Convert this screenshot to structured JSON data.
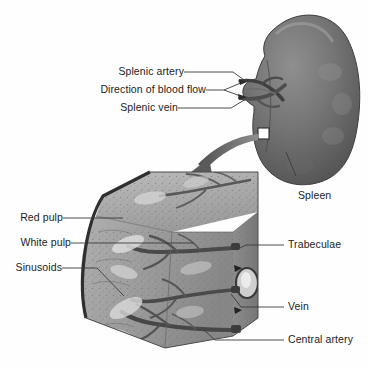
{
  "figure": {
    "background_color": "#fefefe",
    "text_color": "#1c1c1c",
    "leader_line_color": "#3a3a3a"
  },
  "organ": {
    "name": "spleen",
    "shape": "comma-shaped organ with hilum notch on medial (left) border",
    "fill_dark": "#5e5e5e",
    "fill_mid": "#7b7b7b",
    "fill_light": "#9a9a9a",
    "outline_color": "#3d3d3d"
  },
  "inset_box": {
    "name": "sample-region-box",
    "stroke": "#2b2b2b",
    "fill": "#ffffff"
  },
  "magnify_arrow": {
    "name": "magnification-arrow",
    "direction": "from spleen sample box down-left to tissue block",
    "color": "#6e6e6e"
  },
  "tissue_block": {
    "name": "splenic-tissue-cutaway-block",
    "capsule_color": "#2f2f2f",
    "top_face_color": "#a8a8a8",
    "front_face_color": "#9d9d9d",
    "side_face_color": "#8a8a8a",
    "vessel_color": "#4a4a4a",
    "white_pulp_color": "#d8d8d8",
    "vein_ring_color": "#3a3a3a"
  },
  "labels": {
    "splenic_artery": "Splenic artery",
    "direction_of_blood_flow": "Direction of blood flow",
    "splenic_vein": "Splenic vein",
    "spleen": "Spleen",
    "red_pulp": "Red pulp",
    "white_pulp": "White pulp",
    "sinusoids": "Sinusoids",
    "trabeculae": "Trabeculae",
    "vein": "Vein",
    "central_artery": "Central artery"
  }
}
